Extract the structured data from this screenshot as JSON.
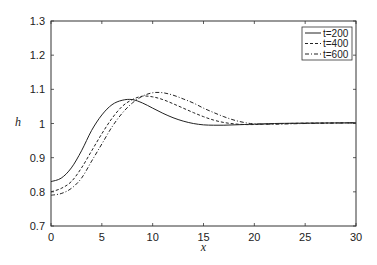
{
  "chart_data": {
    "type": "line",
    "title": "",
    "xlabel": "x",
    "ylabel": "h",
    "xlim": [
      0,
      30
    ],
    "ylim": [
      0.7,
      1.3
    ],
    "xticks": [
      "0",
      "5",
      "10",
      "15",
      "20",
      "25",
      "30"
    ],
    "yticks": [
      "0.7",
      "0.8",
      "0.9",
      "1",
      "1.1",
      "1.2",
      "1.3"
    ],
    "grid": false,
    "legend_position": "upper right",
    "x": [
      0,
      1,
      2,
      3,
      4,
      5,
      6,
      7,
      8,
      9,
      10,
      11,
      12,
      13,
      14,
      15,
      16,
      17,
      18,
      19,
      20,
      22,
      25,
      30
    ],
    "series": [
      {
        "name": "t=200",
        "style": "solid",
        "values": [
          0.83,
          0.84,
          0.87,
          0.92,
          0.98,
          1.025,
          1.055,
          1.068,
          1.07,
          1.06,
          1.045,
          1.03,
          1.017,
          1.007,
          1.0,
          0.996,
          0.995,
          0.995,
          0.996,
          0.997,
          0.998,
          1.0,
          1.001,
          1.002
        ]
      },
      {
        "name": "t=400",
        "style": "dashed",
        "values": [
          0.8,
          0.81,
          0.83,
          0.87,
          0.92,
          0.97,
          1.015,
          1.05,
          1.07,
          1.08,
          1.078,
          1.07,
          1.058,
          1.045,
          1.032,
          1.02,
          1.01,
          1.003,
          0.999,
          0.997,
          0.997,
          0.999,
          1.001,
          1.002
        ]
      },
      {
        "name": "t=600",
        "style": "dashdot",
        "values": [
          0.79,
          0.795,
          0.81,
          0.84,
          0.89,
          0.94,
          0.99,
          1.03,
          1.06,
          1.08,
          1.09,
          1.09,
          1.083,
          1.072,
          1.06,
          1.045,
          1.032,
          1.02,
          1.01,
          1.003,
          0.999,
          0.998,
          1.0,
          1.002
        ]
      }
    ]
  }
}
